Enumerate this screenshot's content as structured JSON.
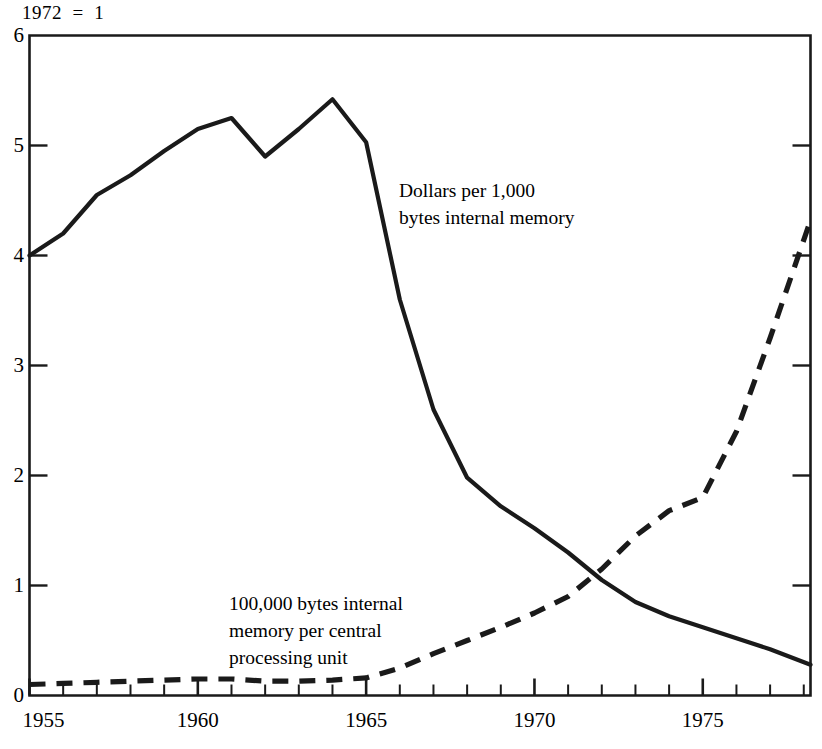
{
  "header": {
    "index_note": "1972  =  1"
  },
  "annotations": {
    "solid_series_label": "Dollars per 1,000\nbytes internal memory",
    "dashed_series_label": "100,000 bytes internal\nmemory per central\nprocessing unit"
  },
  "axes": {
    "y_ticks": [
      "0",
      "1",
      "2",
      "3",
      "4",
      "5",
      "6"
    ],
    "x_ticks": [
      "1955",
      "1960",
      "1965",
      "1970",
      "1975"
    ]
  },
  "colors": {
    "line": "#1a1a1a",
    "axis": "#1a1a1a",
    "background": "#ffffff"
  },
  "chart_data": {
    "type": "line",
    "title": "",
    "subtitle": "1972  =  1",
    "xlabel": "",
    "ylabel": "",
    "xlim": [
      1955,
      1978.2
    ],
    "ylim": [
      0,
      6
    ],
    "grid": false,
    "legend_position": "inline-annotation",
    "x_tick_labels": [
      "1955",
      "1960",
      "1965",
      "1970",
      "1975"
    ],
    "x_tick_values": [
      1955,
      1960,
      1965,
      1970,
      1975
    ],
    "x_minor_tick_interval": 1,
    "y_tick_labels": [
      "0",
      "1",
      "2",
      "3",
      "4",
      "5",
      "6"
    ],
    "y_tick_values": [
      0,
      1,
      2,
      3,
      4,
      5,
      6
    ],
    "series": [
      {
        "name": "Dollars per 1,000 bytes internal memory",
        "style": "solid",
        "x": [
          1955,
          1956,
          1957,
          1958,
          1959,
          1960,
          1961,
          1962,
          1963,
          1964,
          1965,
          1966,
          1967,
          1968,
          1969,
          1970,
          1971,
          1972,
          1973,
          1974,
          1975,
          1976,
          1977,
          1978.2
        ],
        "values": [
          4.0,
          4.2,
          4.55,
          4.73,
          4.95,
          5.15,
          5.25,
          4.9,
          5.15,
          5.42,
          5.03,
          3.6,
          2.6,
          1.98,
          1.72,
          1.52,
          1.3,
          1.05,
          0.85,
          0.72,
          0.62,
          0.52,
          0.42,
          0.28
        ]
      },
      {
        "name": "100,000 bytes internal memory per central processing unit",
        "style": "dashed",
        "x": [
          1955,
          1956,
          1957,
          1958,
          1959,
          1960,
          1961,
          1962,
          1963,
          1964,
          1965,
          1966,
          1967,
          1968,
          1969,
          1970,
          1971,
          1972,
          1973,
          1974,
          1975,
          1976,
          1977,
          1978.2
        ],
        "values": [
          0.1,
          0.11,
          0.12,
          0.13,
          0.14,
          0.15,
          0.15,
          0.13,
          0.13,
          0.14,
          0.16,
          0.25,
          0.38,
          0.5,
          0.62,
          0.75,
          0.9,
          1.15,
          1.45,
          1.68,
          1.8,
          2.4,
          3.25,
          4.32
        ]
      }
    ]
  }
}
